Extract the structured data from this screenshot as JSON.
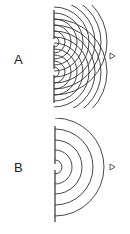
{
  "panels": [
    {
      "label": "A",
      "description": "Double-slit interference: two circular wavefront sources at barrier slits",
      "barrier": {
        "x": 54,
        "y1": 10,
        "y2": 103
      },
      "slits": [
        42,
        72
      ],
      "marker": {
        "x": 112,
        "y": 56
      }
    },
    {
      "label": "B",
      "description": "Single-slit diffraction: semicircular wavefronts from one slit",
      "barrier": {
        "x": 55,
        "y1": 126,
        "y2": 222
      },
      "slits": [
        167
      ],
      "marker": {
        "x": 112,
        "y": 167
      }
    }
  ],
  "colors": {
    "line": "#333333",
    "background": "#ffffff"
  }
}
